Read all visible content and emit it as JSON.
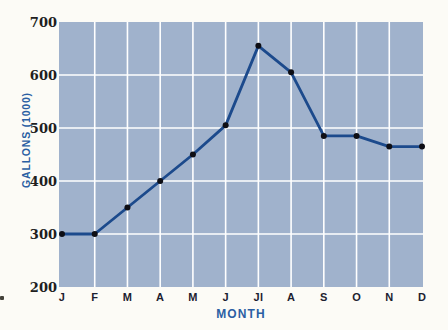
{
  "chart_data": {
    "type": "line",
    "title": "",
    "xlabel": "MONTH",
    "ylabel": "GALLONS (1000)",
    "categories": [
      "J",
      "F",
      "M",
      "A",
      "M",
      "J",
      "Jl",
      "A",
      "S",
      "O",
      "N",
      "D"
    ],
    "values": [
      300,
      300,
      350,
      400,
      450,
      505,
      655,
      605,
      485,
      485,
      465,
      465
    ],
    "ylim": [
      200,
      700
    ],
    "yticks": [
      200,
      300,
      400,
      500,
      600,
      700
    ],
    "grid": "on",
    "legend": "none"
  },
  "colors": {
    "page_background": "#fcfbf6",
    "plot_background": "#a0b2cc",
    "gridline": "#ffffff",
    "line": "#1c4a8c",
    "point": "#0e0e14",
    "tick_label": "#211e1e",
    "axis_label": "#2b5fa3"
  }
}
